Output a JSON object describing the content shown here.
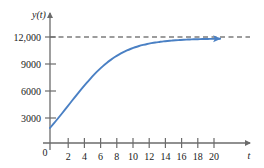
{
  "chart_data": {
    "type": "line",
    "title": "",
    "subtitle": "",
    "xlabel": "t",
    "ylabel": "y(t)",
    "xlim": [
      0,
      22
    ],
    "ylim": [
      0,
      13000
    ],
    "grid": false,
    "legend": false,
    "origin_label": "0",
    "x_ticks": [
      2,
      4,
      6,
      8,
      10,
      12,
      14,
      16,
      18,
      20
    ],
    "x_tick_labels": [
      "2",
      "4",
      "6",
      "8",
      "10",
      "12",
      "14",
      "16",
      "18",
      "20"
    ],
    "y_ticks": [
      3000,
      6000,
      9000,
      12000
    ],
    "y_tick_labels": [
      "3000",
      "6000",
      "9000",
      "12,000"
    ],
    "series": [
      {
        "name": "y(t)",
        "kind": "logistic-curve",
        "color": "#4a80c4",
        "arrow_end": true,
        "x": [
          0,
          0.5,
          1,
          1.5,
          2,
          2.5,
          3,
          3.5,
          4,
          4.5,
          5,
          5.5,
          6,
          6.5,
          7,
          7.5,
          8,
          8.5,
          9,
          9.5,
          10,
          10.5,
          11,
          11.5,
          12,
          12.5,
          13,
          13.5,
          14,
          14.5,
          15,
          15.5,
          16,
          16.5,
          17,
          17.5,
          18,
          18.5,
          19,
          19.5,
          20,
          20.5,
          21
        ],
        "y": [
          1700,
          2240,
          2800,
          3370,
          3950,
          4530,
          5110,
          5680,
          6240,
          6780,
          7300,
          7790,
          8250,
          8670,
          9060,
          9410,
          9730,
          10010,
          10260,
          10480,
          10670,
          10840,
          10980,
          11100,
          11210,
          11300,
          11380,
          11440,
          11500,
          11550,
          11590,
          11630,
          11660,
          11690,
          11710,
          11730,
          11745,
          11760,
          11770,
          11780,
          11790,
          11795,
          11800
        ]
      }
    ],
    "annotations": [
      {
        "kind": "horizontal-asymptote",
        "label": "12,000",
        "value": 12000,
        "style": "dashed",
        "color": "#3a3a3a"
      }
    ],
    "axis_color": "#6b6b6b",
    "text_color": "#1a1a1a",
    "background": "#ffffff"
  }
}
